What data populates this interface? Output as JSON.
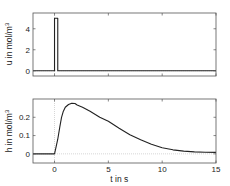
{
  "chart_data": [
    {
      "type": "line",
      "title": "",
      "xlabel": "",
      "ylabel": "u in mol/m",
      "ylabel_superscript": "3",
      "xlim": [
        -2,
        15
      ],
      "ylim": [
        -0.5,
        5.5
      ],
      "xticks": [
        0,
        5,
        10,
        15
      ],
      "xtick_labels_visible": false,
      "yticks": [
        0,
        2,
        4
      ],
      "ytick_labels": [
        "0",
        "2",
        "4"
      ],
      "grid": false,
      "series": [
        {
          "name": "u",
          "x": [
            -2,
            0,
            0,
            0.3,
            0.3,
            15
          ],
          "y": [
            0,
            0,
            5,
            5,
            0,
            0
          ]
        }
      ],
      "reference_lines": {
        "zero_y": 0,
        "zero_x": 0
      }
    },
    {
      "type": "line",
      "title": "",
      "xlabel": "t in s",
      "ylabel": "h in mol/m",
      "ylabel_superscript": "3",
      "xlim": [
        -2,
        15
      ],
      "ylim": [
        -0.05,
        0.3
      ],
      "xticks": [
        0,
        5,
        10,
        15
      ],
      "xtick_labels": [
        "0",
        "5",
        "10",
        "15"
      ],
      "yticks": [
        0,
        0.1,
        0.2
      ],
      "ytick_labels": [
        "0",
        "0.1",
        "0.2"
      ],
      "grid": false,
      "series": [
        {
          "name": "h",
          "x": [
            -2,
            0,
            0.15,
            0.3,
            0.5,
            0.65,
            0.8,
            1.0,
            1.3,
            1.6,
            1.9,
            2.1,
            2.6,
            3.3,
            4.2,
            5,
            6,
            7,
            8,
            9,
            10,
            11,
            12,
            13,
            14,
            15
          ],
          "y": [
            0,
            0,
            0.04,
            0.08,
            0.15,
            0.2,
            0.23,
            0.255,
            0.27,
            0.277,
            0.275,
            0.267,
            0.255,
            0.233,
            0.2,
            0.178,
            0.14,
            0.105,
            0.077,
            0.052,
            0.033,
            0.022,
            0.015,
            0.011,
            0.009,
            0.008
          ]
        }
      ],
      "reference_lines": {
        "zero_y": 0,
        "zero_x": 0
      }
    }
  ]
}
